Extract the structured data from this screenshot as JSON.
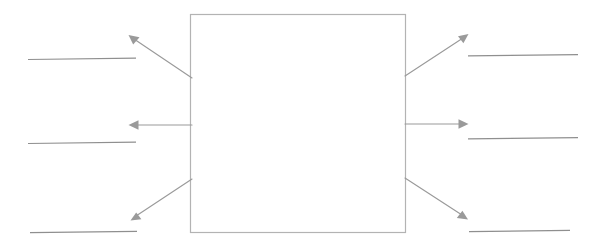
{
  "worksheet": {
    "title": "Blank concept diagram worksheet",
    "description": "Empty central rectangle with six arrows pointing outward to six blank answer lines",
    "background_color": "#ffffff",
    "canvas": {
      "width": 594,
      "height": 244
    }
  },
  "center_box": {
    "label": "",
    "caption": "",
    "fill_color": "#ffffff",
    "border_color": "#b3b3b3",
    "x": 190,
    "y": 14,
    "width": 216,
    "height": 219
  },
  "style": {
    "arrow_color": "#9a9a9a",
    "answer_line_color": "#8f8f8f"
  },
  "answer_lines": [
    {
      "id": "left-top",
      "side": "left",
      "position": "top",
      "text": "",
      "x1": 28,
      "x2": 136,
      "y": 59
    },
    {
      "id": "left-middle",
      "side": "left",
      "position": "middle",
      "text": "",
      "x1": 28,
      "x2": 136,
      "y": 143
    },
    {
      "id": "left-bottom",
      "side": "left",
      "position": "bottom",
      "text": "",
      "x1": 30,
      "x2": 137,
      "y": 232
    },
    {
      "id": "right-top",
      "side": "right",
      "position": "top",
      "text": "",
      "x1": 468,
      "x2": 578,
      "y": 55
    },
    {
      "id": "right-middle",
      "side": "right",
      "position": "middle",
      "text": "",
      "x1": 468,
      "x2": 578,
      "y": 138
    },
    {
      "id": "right-bottom",
      "side": "right",
      "position": "bottom",
      "text": "",
      "x1": 469,
      "x2": 570,
      "y": 231
    }
  ],
  "arrows": [
    {
      "id": "arrow-left-top",
      "direction": "up-left",
      "from": {
        "x": 192,
        "y": 78
      },
      "to": {
        "x": 131,
        "y": 37
      }
    },
    {
      "id": "arrow-left-middle",
      "direction": "left",
      "from": {
        "x": 192,
        "y": 125
      },
      "to": {
        "x": 130,
        "y": 125
      }
    },
    {
      "id": "arrow-left-bottom",
      "direction": "down-left",
      "from": {
        "x": 192,
        "y": 179
      },
      "to": {
        "x": 133,
        "y": 219
      }
    },
    {
      "id": "arrow-right-top",
      "direction": "up-right",
      "from": {
        "x": 405,
        "y": 76
      },
      "to": {
        "x": 466,
        "y": 36
      }
    },
    {
      "id": "arrow-right-middle",
      "direction": "right",
      "from": {
        "x": 405,
        "y": 124
      },
      "to": {
        "x": 467,
        "y": 124
      }
    },
    {
      "id": "arrow-right-bottom",
      "direction": "down-right",
      "from": {
        "x": 405,
        "y": 178
      },
      "to": {
        "x": 466,
        "y": 218
      }
    }
  ]
}
